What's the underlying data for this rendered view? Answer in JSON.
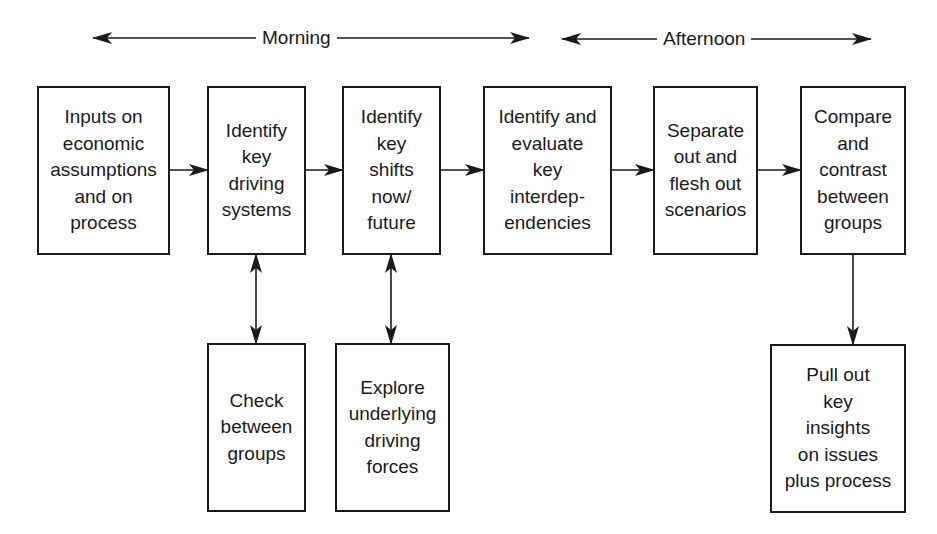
{
  "diagram": {
    "type": "flowchart",
    "colors": {
      "stroke": "#1a1a1a",
      "background": "#ffffff",
      "text": "#1a1a1a"
    },
    "periods": [
      {
        "id": "morning",
        "label": "Morning"
      },
      {
        "id": "afternoon",
        "label": "Afternoon"
      }
    ],
    "nodes": [
      {
        "id": "inputs",
        "text": "Inputs on\neconomic\nassumptions\nand on\nprocess"
      },
      {
        "id": "driving-systems",
        "text": "Identify\nkey\ndriving\nsystems"
      },
      {
        "id": "key-shifts",
        "text": "Identify\nkey\nshifts\nnow/\nfuture"
      },
      {
        "id": "interdependencies",
        "text": "Identify and\nevaluate\nkey\ninterdep-\nendencies"
      },
      {
        "id": "scenarios",
        "text": "Separate\nout and\nflesh out\nscenarios"
      },
      {
        "id": "compare",
        "text": "Compare\nand\ncontrast\nbetween\ngroups"
      },
      {
        "id": "check-groups",
        "text": "Check\nbetween\ngroups"
      },
      {
        "id": "driving-forces",
        "text": "Explore\nunderlying\ndriving\nforces"
      },
      {
        "id": "insights",
        "text": "Pull out\nkey\ninsights\non issues\nplus process"
      }
    ],
    "edges": [
      {
        "from": "inputs",
        "to": "driving-systems",
        "direction": "forward"
      },
      {
        "from": "driving-systems",
        "to": "key-shifts",
        "direction": "forward"
      },
      {
        "from": "key-shifts",
        "to": "interdependencies",
        "direction": "forward"
      },
      {
        "from": "interdependencies",
        "to": "scenarios",
        "direction": "forward"
      },
      {
        "from": "scenarios",
        "to": "compare",
        "direction": "forward"
      },
      {
        "from": "driving-systems",
        "to": "check-groups",
        "direction": "both"
      },
      {
        "from": "key-shifts",
        "to": "driving-forces",
        "direction": "both"
      },
      {
        "from": "compare",
        "to": "insights",
        "direction": "forward"
      }
    ]
  }
}
